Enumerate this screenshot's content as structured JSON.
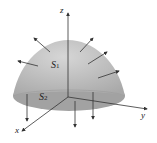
{
  "figure": {
    "surfaces": [
      {
        "name": "S",
        "subscript": "1"
      },
      {
        "name": "S",
        "subscript": "2"
      }
    ],
    "axes": {
      "x": "x",
      "y": "y",
      "z": "z"
    },
    "colors": {
      "surface": "#b5b5b5",
      "base": "#9c9c9c",
      "arrow": "#333333"
    }
  }
}
